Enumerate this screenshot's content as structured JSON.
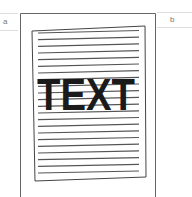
{
  "figure": {
    "labels": {
      "left": "a",
      "right": "b"
    },
    "document_text": "TEXT",
    "line_count": 22,
    "colors": {
      "stroke": "#555555",
      "text": "#1a1a1a",
      "light_rule": "#cccccc"
    }
  }
}
